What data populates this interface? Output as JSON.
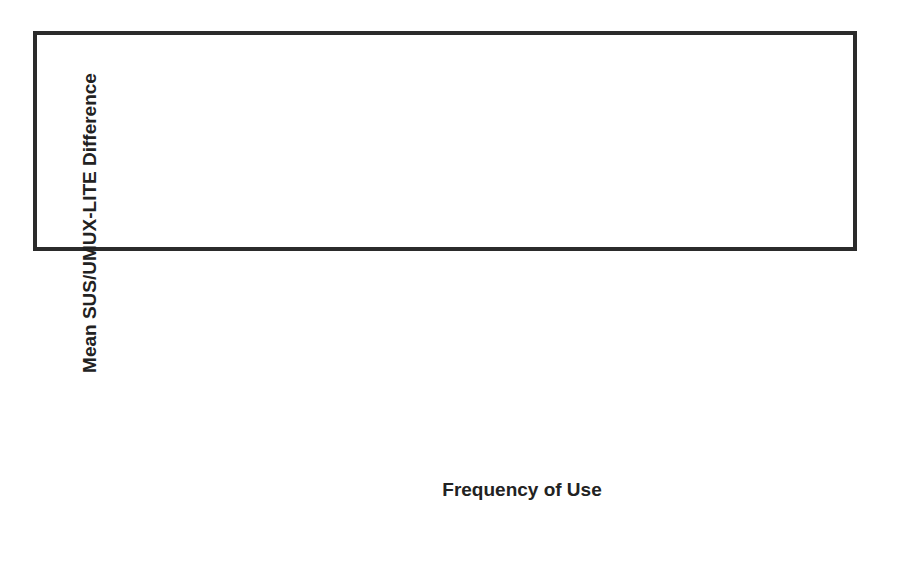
{
  "chart_data": {
    "type": "line",
    "title": "",
    "xlabel": "Frequency of Use",
    "ylabel": "Mean SUS/UMUX-LITE Difference",
    "categories": [
      [
        "> 1/every",
        "few weeks"
      ],
      [
        "1/every",
        "few weeks"
      ],
      [
        "1/week"
      ],
      [
        "> 1/week"
      ],
      [
        "1/day"
      ],
      [
        "> 1/day"
      ]
    ],
    "category_labels": [
      "> 1/every few weeks",
      "1/every few weeks",
      "1/week",
      "> 1/week",
      "1/day",
      "> 1/day"
    ],
    "series": [
      {
        "name": "Mean SUS/UMUX-LITE Difference",
        "values": [
          0.3,
          1.4,
          -1.4,
          0.2,
          3.1,
          2.8
        ],
        "color": "#262626",
        "marker": "circle"
      }
    ],
    "ylim": [
      -25,
      25
    ],
    "yticks": [
      25,
      20,
      15,
      10,
      5,
      0,
      -5,
      -10,
      -15,
      -20,
      -25
    ],
    "ytick_labels": [
      "25,0",
      "20,0",
      "15,0",
      "10,0",
      "5,0",
      "0,0",
      "-5,0",
      "-10,0",
      "-15,0",
      "-20,0",
      "-25,0"
    ],
    "grid": true,
    "legend": "none"
  }
}
